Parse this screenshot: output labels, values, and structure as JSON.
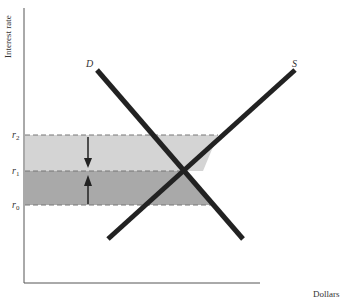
{
  "diagram": {
    "type": "supply-demand",
    "y_axis_label": "Interest rate",
    "x_axis_label": "Dollars",
    "curves": [
      {
        "name": "demand",
        "label": "D"
      },
      {
        "name": "supply",
        "label": "S"
      }
    ],
    "rate_levels": [
      {
        "name": "r2",
        "base": "r",
        "sub": "2"
      },
      {
        "name": "r1",
        "base": "r",
        "sub": "1"
      },
      {
        "name": "r0",
        "base": "r",
        "sub": "0"
      }
    ],
    "bands": [
      {
        "name": "upper-band",
        "from": "r1",
        "to": "r2",
        "color": "#d4d4d4"
      },
      {
        "name": "lower-band",
        "from": "r0",
        "to": "r1",
        "color": "#a9a9a9"
      }
    ],
    "arrows": [
      {
        "name": "arrow-down",
        "direction": "down",
        "from": "r2",
        "to": "r1"
      },
      {
        "name": "arrow-up",
        "direction": "up",
        "from": "r0",
        "to": "r1"
      }
    ],
    "colors": {
      "curve": "#222222",
      "axis": "#555555",
      "dash": "#777777"
    }
  }
}
